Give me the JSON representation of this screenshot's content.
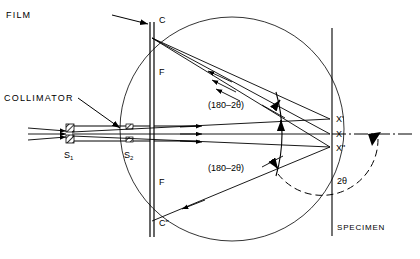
{
  "figure": {
    "background": "#ffffff",
    "ink": "#000000",
    "width": 420,
    "height": 259
  },
  "labels": {
    "film": "FILM",
    "collimator": "COLLIMATOR",
    "specimen": "SPECIMEN",
    "point_c_top": "C",
    "point_c_bottom": "C\"",
    "film_upper": "F",
    "film_lower": "F",
    "slit_1": "S",
    "slit_1_sub": "1",
    "slit_2": "S",
    "slit_2_sub": "2",
    "x_prime": "X'",
    "x_center": "X",
    "x_double_prime": "X\"",
    "angle_upper": "(180–2θ)",
    "angle_lower": "(180–2θ)",
    "two_theta": "2θ"
  },
  "geometry": {
    "focusing_circle": {
      "cx": 232,
      "cy": 129,
      "r": 112
    },
    "film_plane_x": 152,
    "film_top_y": 22,
    "film_bottom_y": 237,
    "specimen_plane_x": 332,
    "specimen_top_y": 28,
    "specimen_bottom_y": 236,
    "point_C": {
      "x": 152,
      "y": 38
    },
    "point_C2": {
      "x": 152,
      "y": 221
    },
    "point_S1": {
      "x": 72,
      "y": 133
    },
    "point_S2": {
      "x": 130,
      "y": 133
    },
    "point_X_prime": {
      "x": 330,
      "y": 119
    },
    "point_X": {
      "x": 330,
      "y": 134
    },
    "point_X_dprime": {
      "x": 330,
      "y": 147
    },
    "specimen_arc": {
      "cx": 190,
      "cy": 133,
      "r": 95
    },
    "two_theta_arc": {
      "cx": 330,
      "cy": 134,
      "r": 52
    },
    "axis_dashdot_end": 412
  }
}
